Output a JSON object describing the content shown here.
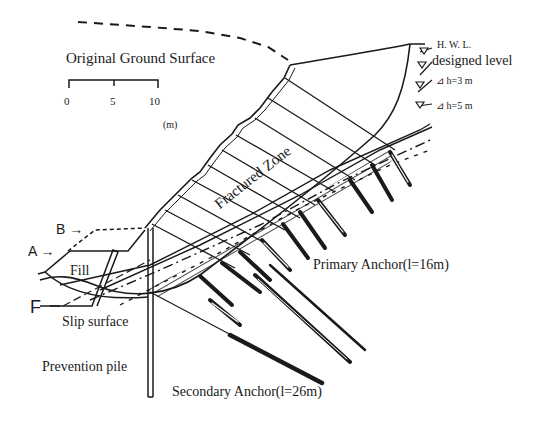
{
  "figure": {
    "title_label": "Original Ground Surface",
    "scale_bar": {
      "ticks": [
        "0",
        "5",
        "10"
      ],
      "unit": "(m)"
    },
    "water_levels": {
      "hwl": "H. W. L.",
      "designed": "designed level",
      "h3": "⊿ h=3  m",
      "h5": "⊿ h=5  m"
    },
    "zones": {
      "fractured": "Fractured Zone",
      "fill": "Fill"
    },
    "markers": {
      "a": "A →",
      "b": "B →",
      "f": "F"
    },
    "labels": {
      "slip_surface": "Slip surface",
      "prevention_pile": "Prevention pile",
      "primary_anchor": "Primary Anchor(l=16m)",
      "secondary_anchor": "Secondary Anchor(l=26m)"
    }
  }
}
